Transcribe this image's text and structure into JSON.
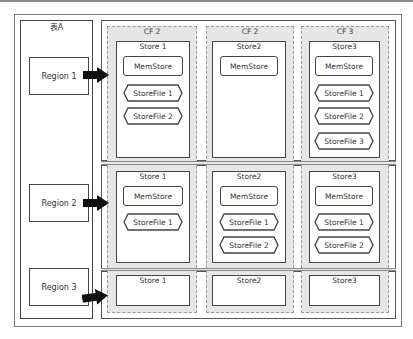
{
  "table": {
    "label": "表A"
  },
  "regions": [
    {
      "label": "Region 1"
    },
    {
      "label": "Region 2"
    },
    {
      "label": "Region 3"
    }
  ],
  "column_families": [
    {
      "label": "CF 2"
    },
    {
      "label": "CF 2"
    },
    {
      "label": "CF 3"
    }
  ],
  "rows": [
    {
      "stores": [
        {
          "label": "Store 1",
          "memstore": "MemStore",
          "storefiles": [
            "StoreFile 1",
            "StoreFile 2"
          ]
        },
        {
          "label": "Store2",
          "memstore": "MemStore",
          "storefiles": []
        },
        {
          "label": "Store3",
          "memstore": "MemStore",
          "storefiles": [
            "StoreFile 1",
            "StoreFile 2",
            "StoreFile 3"
          ]
        }
      ]
    },
    {
      "stores": [
        {
          "label": "Store 1",
          "memstore": "MemStore",
          "storefiles": [
            "StoreFile 1"
          ]
        },
        {
          "label": "Store2",
          "memstore": "MemStore",
          "storefiles": [
            "StoreFile 1",
            "StoreFile 2"
          ]
        },
        {
          "label": "Store3",
          "memstore": "MemStore",
          "storefiles": [
            "StoreFile 1",
            "StoreFile 2"
          ]
        }
      ]
    },
    {
      "stores": [
        {
          "label": "Store 1"
        },
        {
          "label": "Store2"
        },
        {
          "label": "Store3"
        }
      ]
    }
  ]
}
